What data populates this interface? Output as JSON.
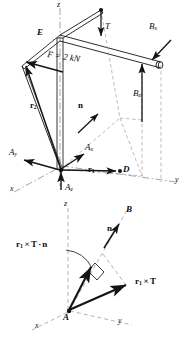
{
  "figure": {
    "ink_color": "#141414",
    "dashed_color": "#9a9a9a",
    "panels": [
      {
        "name": "upper-panel",
        "description": "Free-body diagram of bent bar ADE supported at A and B with cable tension T and applied force F",
        "axes": [
          {
            "name": "z-axis",
            "label": "z",
            "style": "dash-dot"
          },
          {
            "name": "x-axis",
            "label": "x",
            "style": "dash-dot"
          },
          {
            "name": "y-axis",
            "label": "y",
            "style": "dash-dot"
          }
        ],
        "points": [
          {
            "name": "point-E",
            "label": "E"
          },
          {
            "name": "point-D",
            "label": "D"
          }
        ],
        "vectors": [
          {
            "name": "tension-T",
            "label": "T",
            "style": "italic"
          },
          {
            "name": "applied-force-F",
            "label": "F = 2 kN",
            "style": "italic"
          },
          {
            "name": "reaction-Bx",
            "label": "B",
            "subscript": "x"
          },
          {
            "name": "reaction-Bz",
            "label": "B",
            "subscript": "z"
          },
          {
            "name": "reaction-Ax",
            "label": "A",
            "subscript": "x"
          },
          {
            "name": "reaction-Ay",
            "label": "A",
            "subscript": "y"
          },
          {
            "name": "reaction-Az",
            "label": "A",
            "subscript": "z"
          },
          {
            "name": "position-vector-r1",
            "label": "r",
            "subscript": "1",
            "style": "bold"
          },
          {
            "name": "position-vector-r2",
            "label": "r",
            "subscript": "2",
            "style": "bold"
          },
          {
            "name": "unit-normal-n",
            "label": "n",
            "style": "bold"
          }
        ]
      },
      {
        "name": "lower-panel",
        "description": "Moment vector r1 x T resolved along axis AB via the scalar triple product",
        "axes": [
          {
            "name": "z-axis",
            "label": "z",
            "style": "dashed"
          },
          {
            "name": "x-axis",
            "label": "x",
            "style": "dashed"
          },
          {
            "name": "y-axis",
            "label": "y",
            "style": "dashed"
          }
        ],
        "points": [
          {
            "name": "point-A",
            "label": "A"
          },
          {
            "name": "point-B",
            "label": "B"
          }
        ],
        "vectors": [
          {
            "name": "unit-normal-n",
            "label": "n",
            "style": "bold"
          },
          {
            "name": "moment-vector",
            "label": "r",
            "subscript": "1",
            "operator": " × ",
            "second": "T"
          },
          {
            "name": "scalar-triple-product",
            "label": "r",
            "subscript": "1",
            "operator": " × ",
            "second": "T",
            "dot": " · ",
            "third": "n"
          }
        ],
        "marks": [
          {
            "name": "right-angle-mark",
            "label": ""
          },
          {
            "name": "projection-arc",
            "label": ""
          }
        ]
      }
    ]
  },
  "upper": {
    "axis_z": "z",
    "axis_x": "x",
    "axis_y": "y",
    "point_e": "E",
    "point_d": "D",
    "tension": "T",
    "force": "F = 2 kN",
    "bx_base": "B",
    "bx_sub": "x",
    "bz_base": "B",
    "bz_sub": "z",
    "ax_base": "A",
    "ax_sub": "x",
    "ay_base": "A",
    "ay_sub": "y",
    "az_base": "A",
    "az_sub": "z",
    "r1_base": "r",
    "r1_sub": "1",
    "r2_base": "r",
    "r2_sub": "2",
    "normal": "n"
  },
  "lower": {
    "axis_z": "z",
    "axis_x": "x",
    "axis_y": "y",
    "point_a": "A",
    "point_b": "B",
    "normal": "n",
    "moment_r": "r",
    "moment_sub": "1",
    "moment_cross": "×",
    "moment_t": "T",
    "triple_r": "r",
    "triple_sub": "1",
    "triple_cross": "×",
    "triple_t": "T",
    "triple_dot": "·",
    "triple_n": "n"
  }
}
